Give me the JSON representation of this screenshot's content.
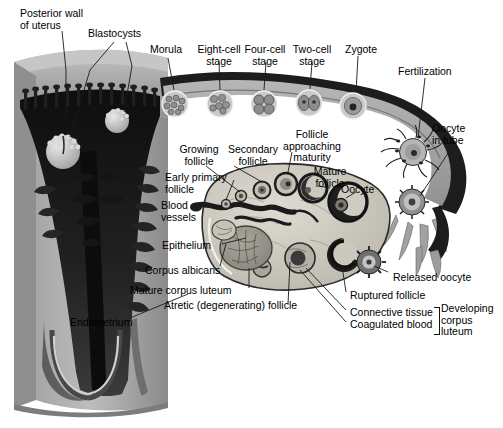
{
  "figure": {
    "palette": {
      "background": "#ffffff",
      "myometrium_light": "#b9b9b9",
      "myometrium_mid": "#9a9a9a",
      "endometrium_dark": "#2e2e2e",
      "cavity_black": "#161616",
      "tube_wall": "#1a1a1a",
      "tube_lumen": "#a8a8a8",
      "ovary_stroma": "#c9c6bd",
      "ovary_outline": "#2a2a2a",
      "corpus_luteum": "#8e8b82",
      "label_text": "#000000",
      "leader_line": "#1a1a1a"
    }
  },
  "labels": [
    {
      "id": "posterior-wall-of-uterus",
      "text": "Posterior wall\nof uterus",
      "x": 20,
      "y": 8,
      "align": "left"
    },
    {
      "id": "blastocysts",
      "text": "Blastocysts",
      "x": 88,
      "y": 28,
      "align": "left"
    },
    {
      "id": "morula",
      "text": "Morula",
      "x": 150,
      "y": 44,
      "align": "left"
    },
    {
      "id": "eight-cell-stage",
      "text": "Eight-cell\nstage",
      "x": 197,
      "y": 44,
      "align": "center"
    },
    {
      "id": "four-cell-stage",
      "text": "Four-cell\nstage",
      "x": 247,
      "y": 44,
      "align": "center"
    },
    {
      "id": "two-cell-stage",
      "text": "Two-cell\nstage",
      "x": 296,
      "y": 44,
      "align": "center"
    },
    {
      "id": "zygote",
      "text": "Zygote",
      "x": 345,
      "y": 44,
      "align": "left"
    },
    {
      "id": "fertilization",
      "text": "Fertilization",
      "x": 398,
      "y": 66,
      "align": "left"
    },
    {
      "id": "oocyte-in-tube",
      "text": "Oocyte\nin tube",
      "x": 432,
      "y": 123,
      "align": "left"
    },
    {
      "id": "growing-follicle",
      "text": "Growing\nfollicle",
      "x": 179,
      "y": 144,
      "align": "center"
    },
    {
      "id": "secondary-follicle",
      "text": "Secondary\nfollicle",
      "x": 222,
      "y": 144,
      "align": "center"
    },
    {
      "id": "follicle-approaching-maturity",
      "text": "Follicle\napproaching\nmaturity",
      "x": 283,
      "y": 129,
      "align": "center"
    },
    {
      "id": "mature-follicle",
      "text": "Mature\nfollicle",
      "x": 314,
      "y": 166,
      "align": "center"
    },
    {
      "id": "early-primary-follicle",
      "text": "Early primary\nfollicle",
      "x": 165,
      "y": 172,
      "align": "left"
    },
    {
      "id": "oocyte",
      "text": "Oocyte",
      "x": 341,
      "y": 184,
      "align": "left"
    },
    {
      "id": "blood-vessels",
      "text": "Blood\nvessels",
      "x": 161,
      "y": 200,
      "align": "left"
    },
    {
      "id": "epithelium",
      "text": "Epithelium",
      "x": 162,
      "y": 240,
      "align": "left"
    },
    {
      "id": "corpus-albicans",
      "text": "Corpus albicans",
      "x": 145,
      "y": 265,
      "align": "left"
    },
    {
      "id": "mature-corpus-luteum",
      "text": "Mature corpus luteum",
      "x": 130,
      "y": 285,
      "align": "left"
    },
    {
      "id": "atretic-degenerating-follicle",
      "text": "Atretic (degenerating) follicle",
      "x": 164,
      "y": 300,
      "align": "left"
    },
    {
      "id": "endometrium",
      "text": "Endometrium",
      "x": 70,
      "y": 317,
      "align": "left"
    },
    {
      "id": "released-oocyte",
      "text": "Released oocyte",
      "x": 393,
      "y": 272,
      "align": "left"
    },
    {
      "id": "ruptured-follicle",
      "text": "Ruptured follicle",
      "x": 350,
      "y": 290,
      "align": "left"
    },
    {
      "id": "connective-tissue",
      "text": "Connective tissue",
      "x": 350,
      "y": 309,
      "align": "left"
    },
    {
      "id": "coagulated-blood",
      "text": "Coagulated blood",
      "x": 350,
      "y": 321,
      "align": "left"
    },
    {
      "id": "developing-corpus-luteum",
      "text": "Developing\ncorpus\nluteum",
      "x": 441,
      "y": 303,
      "align": "left"
    }
  ],
  "structures": {
    "embryo_stages": [
      {
        "id": "morula",
        "label": "Morula",
        "cells": "many",
        "cx": 175,
        "cy": 104
      },
      {
        "id": "eight-cell",
        "label": "Eight-cell stage",
        "cells": "8",
        "cx": 220,
        "cy": 104
      },
      {
        "id": "four-cell",
        "label": "Four-cell stage",
        "cells": "4",
        "cx": 264,
        "cy": 104
      },
      {
        "id": "two-cell",
        "label": "Two-cell stage",
        "cells": "2",
        "cx": 309,
        "cy": 103
      },
      {
        "id": "zygote",
        "label": "Zygote",
        "cells": "1",
        "cx": 353,
        "cy": 106
      }
    ],
    "blastocysts": [
      {
        "id": "blastocyst-1",
        "cx": 63,
        "cy": 152
      },
      {
        "id": "blastocyst-2",
        "cx": 117,
        "cy": 121
      }
    ],
    "follicle_sequence": [
      "early primary follicle",
      "growing follicle",
      "secondary follicle",
      "follicle approaching maturity",
      "mature follicle",
      "ruptured follicle",
      "developing corpus luteum",
      "mature corpus luteum",
      "corpus albicans"
    ]
  }
}
